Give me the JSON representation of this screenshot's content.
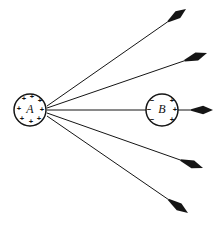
{
  "figure": {
    "background_color": "#ffffff",
    "ink_color": "#151515",
    "width": 219,
    "height": 225
  },
  "bodies": [
    {
      "id": "body-a",
      "label": "A",
      "cx": 30,
      "cy": 110,
      "r": 16,
      "charge_sign": "+",
      "charge_count": 8,
      "charges": [
        {
          "symbol": "+",
          "x": 24,
          "y": 99
        },
        {
          "symbol": "+",
          "x": 32,
          "y": 97
        },
        {
          "symbol": "+",
          "x": 40,
          "y": 101
        },
        {
          "symbol": "+",
          "x": 19,
          "y": 109
        },
        {
          "symbol": "+",
          "x": 42,
          "y": 110
        },
        {
          "symbol": "+",
          "x": 22,
          "y": 119
        },
        {
          "symbol": "+",
          "x": 31,
          "y": 122
        },
        {
          "symbol": "+",
          "x": 39,
          "y": 119
        }
      ]
    },
    {
      "id": "body-b",
      "label": "B",
      "cx": 162,
      "cy": 110,
      "r": 16,
      "charge_sign": "polarized",
      "charge_count": 6,
      "charges": [
        {
          "symbol": "−",
          "x": 152,
          "y": 101
        },
        {
          "symbol": "−",
          "x": 149,
          "y": 110
        },
        {
          "symbol": "−",
          "x": 152,
          "y": 120
        },
        {
          "symbol": "+",
          "x": 172,
          "y": 101
        },
        {
          "symbol": "+",
          "x": 175,
          "y": 110
        },
        {
          "symbol": "+",
          "x": 172,
          "y": 120
        }
      ]
    }
  ],
  "rays": [
    {
      "id": "ray-upper-outer",
      "from_x": 47,
      "from_y": 106,
      "to_x": 186,
      "to_y": 9,
      "head_length": 22,
      "head_width": 4.2,
      "line_width": 1.0
    },
    {
      "id": "ray-upper-inner",
      "from_x": 47,
      "from_y": 108,
      "to_x": 207,
      "to_y": 53,
      "head_length": 24,
      "head_width": 4.2,
      "line_width": 1.0
    },
    {
      "id": "ray-horizontal",
      "from_x": 47,
      "from_y": 110,
      "to_x": 213,
      "to_y": 110,
      "head_length": 22,
      "head_width": 4.2,
      "line_width": 1.0,
      "passes_through": "body-b"
    },
    {
      "id": "ray-lower-inner",
      "from_x": 47,
      "from_y": 113,
      "to_x": 203,
      "to_y": 168,
      "head_length": 24,
      "head_width": 4.2,
      "line_width": 1.0
    },
    {
      "id": "ray-lower-outer",
      "from_x": 47,
      "from_y": 116,
      "to_x": 188,
      "to_y": 213,
      "head_length": 24,
      "head_width": 4.2,
      "line_width": 1.0
    }
  ]
}
